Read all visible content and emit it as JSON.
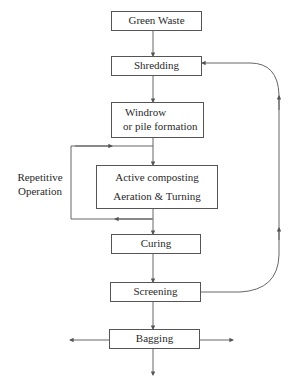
{
  "diagram": {
    "type": "flowchart",
    "title": "",
    "nodes": [
      {
        "id": "green_waste",
        "label": "Green Waste"
      },
      {
        "id": "shredding",
        "label": "Shredding"
      },
      {
        "id": "windrow",
        "label_line1": "Windrow",
        "label_line2": "or pile formation"
      },
      {
        "id": "active",
        "label_line1": "Active composting",
        "label_line2": "Aeration & Turning"
      },
      {
        "id": "curing",
        "label": "Curing"
      },
      {
        "id": "screening",
        "label": "Screening"
      },
      {
        "id": "bagging",
        "label": "Bagging"
      }
    ],
    "loop_label": {
      "line1": "Repetitive",
      "line2": "Operation"
    },
    "edges": [
      {
        "from": "green_waste",
        "to": "shredding"
      },
      {
        "from": "shredding",
        "to": "windrow"
      },
      {
        "from": "windrow",
        "to": "active"
      },
      {
        "from": "active",
        "to": "active",
        "label": "Repetitive Operation",
        "kind": "loop"
      },
      {
        "from": "active",
        "to": "curing"
      },
      {
        "from": "curing",
        "to": "screening"
      },
      {
        "from": "screening",
        "to": "bagging"
      },
      {
        "from": "screening",
        "to": "shredding",
        "kind": "return"
      },
      {
        "from": "bagging",
        "to": "left-output"
      },
      {
        "from": "bagging",
        "to": "right-output"
      },
      {
        "from": "bagging",
        "to": "bottom-output"
      }
    ],
    "colors": {
      "line": "#555555",
      "text": "#2a2a2a",
      "background": "#ffffff"
    }
  }
}
